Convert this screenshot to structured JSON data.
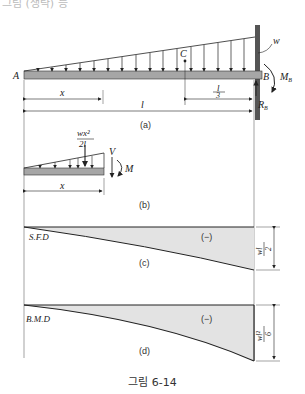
{
  "top_fragment": "그림 (생략) 등",
  "figure_a": {
    "label": "(a)",
    "point_A": "A",
    "point_B": "B",
    "point_C": "C",
    "load": "w",
    "moment": "M",
    "moment_sub": "B",
    "reaction": "R",
    "reaction_sub": "B",
    "dim_x": "x",
    "dim_l": "l",
    "dim_l3_num": "l",
    "dim_l3_den": "3"
  },
  "figure_b": {
    "label": "(b)",
    "resultant_num": "wx²",
    "resultant_den": "2l",
    "shear": "V",
    "moment": "M",
    "dim_x": "x"
  },
  "figure_c": {
    "label": "(c)",
    "title": "S.F.D",
    "sign": "(−)",
    "max_num": "wl",
    "max_den": "2"
  },
  "figure_d": {
    "label": "(d)",
    "title": "B.M.D",
    "sign": "(−)",
    "max_num": "wl²",
    "max_den": "6"
  },
  "caption": "그림 6-14",
  "colors": {
    "beam": "#a6a6a6",
    "wall": "#555555",
    "fill": "#e3e3e3",
    "line": "#222222"
  }
}
